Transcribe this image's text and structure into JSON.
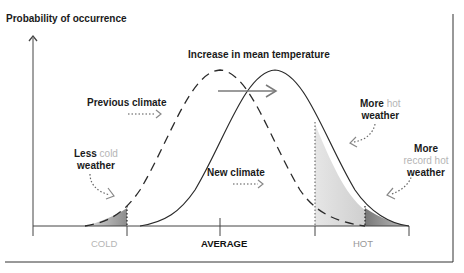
{
  "diagram": {
    "y_axis_title": "Probability of occurrence",
    "title_increase": "Increase in mean temperature",
    "previous_climate": "Previous climate",
    "new_climate": "New climate",
    "less_cold": {
      "line1_a": "Less",
      "line1_b": "cold",
      "line2": "weather"
    },
    "more_hot": {
      "line1_a": "More",
      "line1_b": "hot",
      "line2": "weather"
    },
    "more_record_hot": {
      "line1": "More",
      "line2": "record hot",
      "line3": "weather"
    },
    "x_labels": {
      "cold": "COLD",
      "average": "AVERAGE",
      "hot": "HOT"
    },
    "colors": {
      "line": "#2a2a2a",
      "muted_text": "#b5b5b5",
      "arrow": "#7a7a7a",
      "shade_light": "#dcdcdc",
      "shade_dark": "#8a8a8a"
    }
  }
}
